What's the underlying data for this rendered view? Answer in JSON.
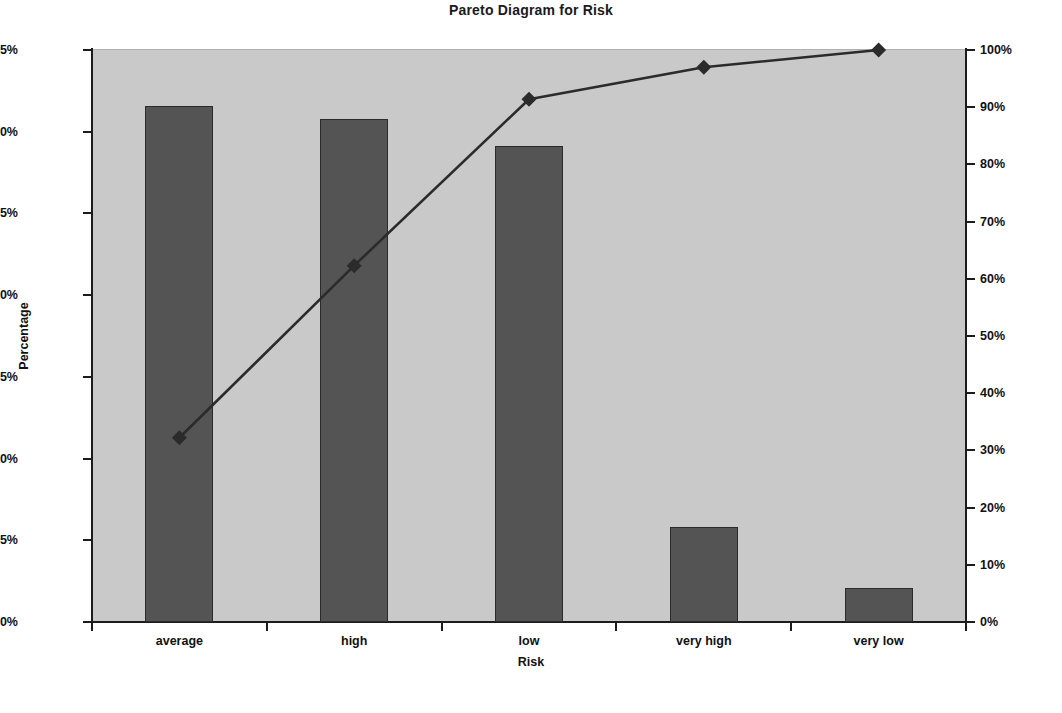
{
  "chart_data": {
    "type": "bar",
    "title": "Pareto Diagram for Risk",
    "xlabel": "Risk",
    "ylabel": "Percentage",
    "ylabel_right": "",
    "categories": [
      "average",
      "high",
      "low",
      "very high",
      "very low"
    ],
    "values": [
      31.6,
      30.8,
      29.1,
      5.8,
      2.1
    ],
    "value_labels": [
      "31.6%",
      "30.8%",
      "29.1%",
      "5.8%",
      "2.1%"
    ],
    "cumulative": [
      32.2,
      62.3,
      91.4,
      97.0,
      100.0
    ],
    "cumulative_labels": [
      "32%",
      "62%",
      "91%",
      "97%",
      "100%"
    ],
    "ylim": [
      0,
      35
    ],
    "ylim_right": [
      0,
      100
    ],
    "yticks": [
      0,
      5,
      10,
      15,
      20,
      25,
      30,
      35
    ],
    "ytick_labels": [
      "0%",
      "5%",
      "10%",
      "15%",
      "20%",
      "25%",
      "30%",
      "35%"
    ],
    "yticks_right": [
      0,
      10,
      20,
      30,
      40,
      50,
      60,
      70,
      80,
      90,
      100
    ],
    "ytick_labels_right": [
      "0%",
      "10%",
      "20%",
      "30%",
      "40%",
      "50%",
      "60%",
      "70%",
      "80%",
      "90%",
      "100%"
    ],
    "grid": false,
    "legend": false,
    "legend_position": "none",
    "series": [
      {
        "name": "Percentage",
        "type": "bar",
        "values": [
          31.6,
          30.8,
          29.1,
          5.8,
          2.1
        ],
        "color": "#545454",
        "axis": "left"
      },
      {
        "name": "Cumulative",
        "type": "line",
        "values": [
          32.2,
          62.3,
          91.4,
          97.0,
          100.0
        ],
        "color": "#2b2b2b",
        "marker": "diamond",
        "axis": "right"
      }
    ]
  },
  "colors": {
    "plot_background": "#c9c9c9",
    "page_background": "#ffffff",
    "bar_fill": "#545454",
    "bar_border": "#2b2b2b",
    "line": "#2b2b2b",
    "axis": "#1c1c1c",
    "text": "#111111"
  }
}
